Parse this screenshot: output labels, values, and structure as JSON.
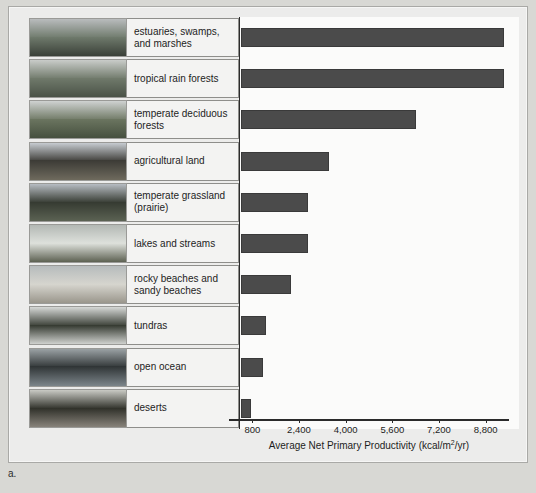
{
  "figure": {
    "panel_letter": "a.",
    "axis_title_main": "Average Net Primary Productivity (kcal/m",
    "axis_title_sup": "2",
    "axis_title_tail": "/yr)"
  },
  "chart_data": {
    "type": "bar",
    "orientation": "horizontal",
    "title": "",
    "xlabel": "Average Net Primary Productivity (kcal/m2/yr)",
    "ylabel": "",
    "xlim": [
      0,
      9600
    ],
    "xticks": [
      800,
      2400,
      4000,
      5600,
      7200,
      8800
    ],
    "xtick_labels": [
      "800",
      "2,400",
      "4,000",
      "5,600",
      "7,200",
      "8,800"
    ],
    "grid": false,
    "legend": "none",
    "bar_color": "#4b4b4b",
    "categories": [
      "estuaries, swamps, and marshes",
      "tropical rain forests",
      "temperate deciduous forests",
      "agricultural land",
      "temperate grassland (prairie)",
      "lakes and streams",
      "rocky beaches and sandy beaches",
      "tundras",
      "open ocean",
      "deserts"
    ],
    "values": [
      9000,
      9000,
      6000,
      3000,
      2300,
      2300,
      1700,
      850,
      750,
      350
    ]
  },
  "rows": [
    {
      "label": "estuaries, swamps,\nand marshes",
      "label_line1": "estuaries, swamps,",
      "label_line2": "and marshes",
      "value": 9000,
      "thumb_name": "estuary-marsh-photo",
      "sky": "#b9bcbd",
      "ground": "#3a4038",
      "accent": "#6f7a6c"
    },
    {
      "label": "tropical rain forests",
      "label_line1": "tropical rain forests",
      "label_line2": "",
      "value": 9000,
      "thumb_name": "tropical-rain-forest-photo",
      "sky": "#c9ccc9",
      "ground": "#4a5247",
      "accent": "#707a6b"
    },
    {
      "label": "temperate deciduous\nforests",
      "label_line1": "temperate deciduous",
      "label_line2": "forests",
      "value": 6000,
      "thumb_name": "temperate-deciduous-forest-photo",
      "sky": "#cfd2d1",
      "ground": "#46503f",
      "accent": "#6b7560"
    },
    {
      "label": "agricultural land",
      "label_line1": "agricultural land",
      "label_line2": "",
      "value": 3000,
      "thumb_name": "agricultural-land-photo",
      "sky": "#c6cbd0",
      "ground": "#6e6a5d",
      "accent": "#3b3a35"
    },
    {
      "label": "temperate grassland\n(prairie)",
      "label_line1": "temperate grassland",
      "label_line2": "(prairie)",
      "value": 2300,
      "thumb_name": "temperate-grassland-photo",
      "sky": "#b7bcc2",
      "ground": "#5b6253",
      "accent": "#353a31"
    },
    {
      "label": "lakes and streams",
      "label_line1": "lakes and streams",
      "label_line2": "",
      "value": 2300,
      "thumb_name": "lakes-and-streams-photo",
      "sky": "#b3b8b4",
      "ground": "#5d6152",
      "accent": "#dfe2dd"
    },
    {
      "label": "rocky beaches and\nsandy beaches",
      "label_line1": "rocky beaches and",
      "label_line2": "sandy beaches",
      "value": 1700,
      "thumb_name": "rocky-sandy-beaches-photo",
      "sky": "#b6bbbc",
      "ground": "#9a968c",
      "accent": "#d7d6cf"
    },
    {
      "label": "tundras",
      "label_line1": "tundras",
      "label_line2": "",
      "value": 850,
      "thumb_name": "tundra-photo",
      "sky": "#d6d8d6",
      "ground": "#cfd1ce",
      "accent": "#33382f"
    },
    {
      "label": "open ocean",
      "label_line1": "open ocean",
      "label_line2": "",
      "value": 750,
      "thumb_name": "open-ocean-photo",
      "sky": "#9aa1a4",
      "ground": "#7c858a",
      "accent": "#2e3334"
    },
    {
      "label": "deserts",
      "label_line1": "deserts",
      "label_line2": "",
      "value": 350,
      "thumb_name": "desert-photo",
      "sky": "#c9cac4",
      "ground": "#87827a",
      "accent": "#2f3029"
    }
  ]
}
